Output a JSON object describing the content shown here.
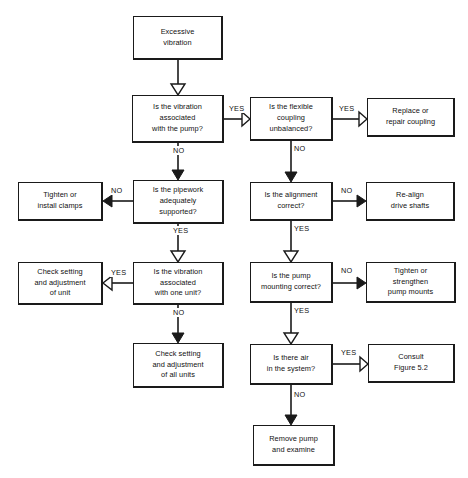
{
  "diagram": {
    "type": "flowchart",
    "line_color": "#1a1a1a",
    "background_color": "#ffffff",
    "nodes": [
      {
        "id": "start",
        "label": "Excessive\nvibration",
        "shape": "rect",
        "x": 133,
        "y": 16,
        "w": 90,
        "h": 44
      },
      {
        "id": "q_vib_pump",
        "label": "Is the vibration\nassociated\nwith the pump?",
        "shape": "rect",
        "x": 132,
        "y": 95,
        "w": 92,
        "h": 48
      },
      {
        "id": "q_coupling",
        "label": "Is the flexible\ncoupling\nunbalanced?",
        "shape": "rect",
        "x": 250,
        "y": 97,
        "w": 83,
        "h": 44
      },
      {
        "id": "a_coupling",
        "label": "Replace or\nrepair coupling",
        "shape": "rect",
        "x": 367,
        "y": 98,
        "w": 88,
        "h": 39
      },
      {
        "id": "a_clamps",
        "label": "Tighten or\ninstall clamps",
        "shape": "rect",
        "x": 18,
        "y": 182,
        "w": 85,
        "h": 39
      },
      {
        "id": "q_pipework",
        "label": "Is the pipework\nadequately\nsupported?",
        "shape": "rect",
        "x": 133,
        "y": 180,
        "w": 91,
        "h": 44
      },
      {
        "id": "q_alignment",
        "label": "Is the alignment\ncorrect?",
        "shape": "rect",
        "x": 250,
        "y": 182,
        "w": 83,
        "h": 39
      },
      {
        "id": "a_realign",
        "label": "Re-align\ndrive shafts",
        "shape": "rect",
        "x": 366,
        "y": 182,
        "w": 89,
        "h": 39
      },
      {
        "id": "a_unit",
        "label": "Check setting\nand adjustment\nof unit",
        "shape": "rect",
        "x": 18,
        "y": 262,
        "w": 85,
        "h": 43
      },
      {
        "id": "q_one_unit",
        "label": "Is the vibration\nassociated\nwith one unit?",
        "shape": "rect",
        "x": 133,
        "y": 262,
        "w": 91,
        "h": 43
      },
      {
        "id": "q_mounting",
        "label": "Is the pump\nmounting correct?",
        "shape": "rect",
        "x": 250,
        "y": 262,
        "w": 83,
        "h": 41
      },
      {
        "id": "a_mounts",
        "label": "Tighten or\nstrengthen\npump mounts",
        "shape": "rect",
        "x": 366,
        "y": 262,
        "w": 90,
        "h": 41
      },
      {
        "id": "a_all_units",
        "label": "Check setting\nand adjustment\nof all units",
        "shape": "rect",
        "x": 133,
        "y": 343,
        "w": 91,
        "h": 45
      },
      {
        "id": "q_air",
        "label": "Is there air\nin the system?",
        "shape": "rect",
        "x": 250,
        "y": 344,
        "w": 83,
        "h": 41
      },
      {
        "id": "a_consult",
        "label": "Consult\nFigure 5.2",
        "shape": "rect",
        "x": 368,
        "y": 344,
        "w": 87,
        "h": 39
      },
      {
        "id": "a_remove",
        "label": "Remove pump\nand examine",
        "shape": "rect",
        "x": 253,
        "y": 425,
        "w": 82,
        "h": 41
      }
    ],
    "edges": [
      {
        "id": "e_start_vib",
        "from": "start",
        "to": "q_vib_pump",
        "label": "",
        "arrow": "hollow",
        "dir": "down"
      },
      {
        "id": "e_vib_coupling",
        "from": "q_vib_pump",
        "to": "q_coupling",
        "label": "YES",
        "arrow": "hollow",
        "dir": "right"
      },
      {
        "id": "e_vib_pipework",
        "from": "q_vib_pump",
        "to": "q_pipework",
        "label": "NO",
        "arrow": "solid",
        "dir": "down"
      },
      {
        "id": "e_coupling_replace",
        "from": "q_coupling",
        "to": "a_coupling",
        "label": "YES",
        "arrow": "hollow",
        "dir": "right"
      },
      {
        "id": "e_coupling_align",
        "from": "q_coupling",
        "to": "q_alignment",
        "label": "NO",
        "arrow": "solid",
        "dir": "down"
      },
      {
        "id": "e_pipework_clamps",
        "from": "q_pipework",
        "to": "a_clamps",
        "label": "NO",
        "arrow": "solid",
        "dir": "left"
      },
      {
        "id": "e_pipework_oneunit",
        "from": "q_pipework",
        "to": "q_one_unit",
        "label": "YES",
        "arrow": "hollow",
        "dir": "down"
      },
      {
        "id": "e_align_realign",
        "from": "q_alignment",
        "to": "a_realign",
        "label": "NO",
        "arrow": "solid",
        "dir": "right"
      },
      {
        "id": "e_align_mounting",
        "from": "q_alignment",
        "to": "q_mounting",
        "label": "YES",
        "arrow": "hollow",
        "dir": "down"
      },
      {
        "id": "e_oneunit_unit",
        "from": "q_one_unit",
        "to": "a_unit",
        "label": "YES",
        "arrow": "hollow",
        "dir": "left"
      },
      {
        "id": "e_oneunit_all",
        "from": "q_one_unit",
        "to": "a_all_units",
        "label": "NO",
        "arrow": "solid",
        "dir": "down"
      },
      {
        "id": "e_mounting_mounts",
        "from": "q_mounting",
        "to": "a_mounts",
        "label": "NO",
        "arrow": "solid",
        "dir": "right"
      },
      {
        "id": "e_mounting_air",
        "from": "q_mounting",
        "to": "q_air",
        "label": "YES",
        "arrow": "hollow",
        "dir": "down"
      },
      {
        "id": "e_air_consult",
        "from": "q_air",
        "to": "a_consult",
        "label": "YES",
        "arrow": "hollow",
        "dir": "right"
      },
      {
        "id": "e_air_remove",
        "from": "q_air",
        "to": "a_remove",
        "label": "NO",
        "arrow": "solid",
        "dir": "down"
      }
    ],
    "edge_labels": [
      {
        "id": "lbl_yes_1",
        "text": "YES",
        "x": 228,
        "y": 104
      },
      {
        "id": "lbl_no_1",
        "text": "NO",
        "x": 172,
        "y": 146
      },
      {
        "id": "lbl_yes_2",
        "text": "YES",
        "x": 338,
        "y": 104
      },
      {
        "id": "lbl_no_2",
        "text": "NO",
        "x": 293,
        "y": 144
      },
      {
        "id": "lbl_no_3",
        "text": "NO",
        "x": 110,
        "y": 186
      },
      {
        "id": "lbl_yes_3",
        "text": "YES",
        "x": 172,
        "y": 226
      },
      {
        "id": "lbl_no_4",
        "text": "NO",
        "x": 340,
        "y": 186
      },
      {
        "id": "lbl_yes_4",
        "text": "YES",
        "x": 293,
        "y": 224
      },
      {
        "id": "lbl_yes_5",
        "text": "YES",
        "x": 110,
        "y": 268
      },
      {
        "id": "lbl_no_5",
        "text": "NO",
        "x": 172,
        "y": 308
      },
      {
        "id": "lbl_no_6",
        "text": "NO",
        "x": 340,
        "y": 266
      },
      {
        "id": "lbl_yes_6",
        "text": "YES",
        "x": 293,
        "y": 306
      },
      {
        "id": "lbl_yes_7",
        "text": "YES",
        "x": 340,
        "y": 348
      },
      {
        "id": "lbl_no_7",
        "text": "NO",
        "x": 293,
        "y": 390
      }
    ]
  }
}
